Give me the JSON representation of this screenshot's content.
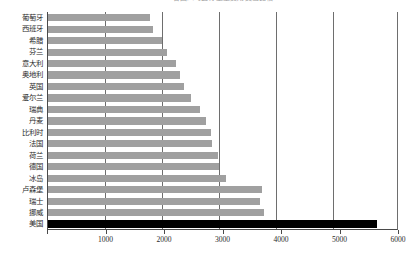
{
  "chart_data": {
    "type": "bar",
    "orientation": "horizontal",
    "title": "各国人均医疗卫生费用支出比较",
    "xlabel": "",
    "ylabel": "",
    "xlim": [
      0,
      6000
    ],
    "xticks": [
      0,
      1000,
      2000,
      3000,
      4000,
      5000,
      6000
    ],
    "xtick_labels": [
      "0",
      "1000",
      "2000",
      "3000",
      "4000",
      "5000",
      "6000"
    ],
    "grid": true,
    "legend": "none",
    "colors": {
      "bar": "#a0a0a0",
      "highlight_bar": "#000000",
      "axis": "#4a4a4a",
      "gridline": "#6e6e6e",
      "text": "#2b2b2b",
      "background": "#ffffff"
    },
    "categories": [
      "葡萄牙",
      "西班牙",
      "希腊",
      "芬兰",
      "意大利",
      "奥地利",
      "英国",
      "爱尔兰",
      "瑞典",
      "丹麦",
      "比利时",
      "法国",
      "荷兰",
      "德国",
      "冰岛",
      "卢森堡",
      "瑞士",
      "挪威",
      "美国"
    ],
    "values": [
      1740,
      1790,
      1950,
      2040,
      2190,
      2250,
      2320,
      2450,
      2600,
      2700,
      2790,
      2810,
      2910,
      2930,
      3050,
      3650,
      3620,
      3690,
      5630
    ],
    "highlight_index": 18
  }
}
